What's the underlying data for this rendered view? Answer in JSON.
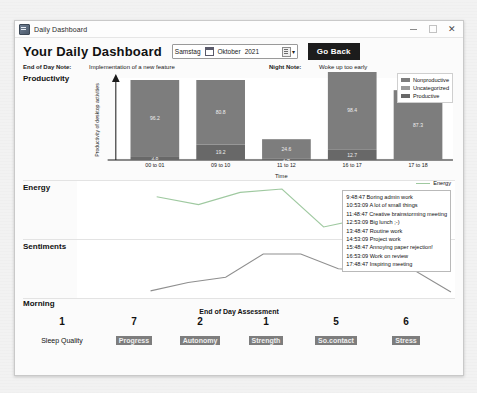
{
  "window": {
    "title": "Daily Dashboard",
    "icon": "app-icon",
    "minimize": "–",
    "maximize": "□",
    "close": "✕"
  },
  "header": {
    "dashboard_title": "Your Daily Dashboard",
    "date_picker": {
      "weekday": "Samstag",
      "month": "Oktober",
      "year": "2021",
      "calendar_icon": "calendar-icon",
      "dropdown_caret": "▾"
    },
    "go_back_label": "Go Back"
  },
  "notes": {
    "eod_label": "End of Day Note:",
    "eod_value": "Implementation of a new feature",
    "night_label": "Night Note:",
    "night_value": "Woke up too early"
  },
  "sections": {
    "productivity": "Productivity",
    "energy": "Energy",
    "sentiments": "Sentiments",
    "morning": "Morning"
  },
  "chart_data": [
    {
      "type": "bar",
      "title": "Productivity",
      "xlabel": "Time",
      "ylabel": "Productivity of desktop activities",
      "categories": [
        "00 to 01",
        "09 to 10",
        "11 to 12",
        "16 to 17",
        "17 to 18"
      ],
      "ylim": [
        0,
        100
      ],
      "grid": false,
      "stacked": true,
      "legend_position": "top-right",
      "series": [
        {
          "name": "Nonproductive",
          "color": "#7d7d7d",
          "values": [
            96.2,
            80.8,
            24.6,
            98.4,
            87.3
          ],
          "labels": [
            "96.2",
            "80.8",
            "24.6",
            "98.4",
            "87.3"
          ]
        },
        {
          "name": "Uncategorized",
          "color": "#9a9a9a",
          "values": [
            0,
            0,
            0,
            0,
            0
          ],
          "labels": [
            "",
            "",
            "",
            "",
            ""
          ]
        },
        {
          "name": "Productive",
          "color": "#686868",
          "values": [
            3.8,
            19.2,
            1.4,
            12.7,
            0
          ],
          "labels": [
            "3.8",
            "19.2",
            "1.4",
            "12.7",
            ""
          ]
        }
      ]
    },
    {
      "type": "line",
      "title": "Energy",
      "legend_entries": [
        "Energy"
      ],
      "color": "#9fc9a0",
      "x": [
        0,
        1,
        2,
        3,
        4,
        5,
        6,
        7
      ],
      "values": [
        72,
        58,
        80,
        86,
        18,
        34,
        55,
        74
      ]
    },
    {
      "type": "line",
      "title": "Sentiments",
      "color": "#8f8f8f",
      "x": [
        0,
        1,
        2,
        3,
        4,
        5,
        6,
        7,
        8
      ],
      "values": [
        10,
        26,
        36,
        80,
        80,
        52,
        48,
        50,
        8
      ]
    }
  ],
  "energy_events": [
    "9:48:47 Boring admin work",
    "10:53:09 A lot of small things",
    "11:48:47 Creative brainstorming meeting",
    "12:53:09 Big lunch ;-)",
    "13:48:47 Routine work",
    "14:53:09 Project work",
    "15:48:47 Annoying paper rejection!",
    "16:53:09 Work on review",
    "17:48:47 Inspiring meeting"
  ],
  "assessment": {
    "title": "End of Day Assessment",
    "items": [
      {
        "value": "1",
        "label": "Sleep Quality",
        "highlight": false
      },
      {
        "value": "7",
        "label": "Progress",
        "highlight": true
      },
      {
        "value": "2",
        "label": "Autonomy",
        "highlight": true
      },
      {
        "value": "1",
        "label": "Strength",
        "highlight": true
      },
      {
        "value": "5",
        "label": "So.contact",
        "highlight": true
      },
      {
        "value": "6",
        "label": "Stress",
        "highlight": true
      }
    ]
  },
  "colors": {
    "accent": "#1c1c1c",
    "bar_nonproductive": "#7d7d7d",
    "bar_uncategorized": "#9a9a9a",
    "bar_productive": "#686868",
    "energy_line": "#9fc9a0",
    "sentiment_line": "#8f8f8f"
  }
}
